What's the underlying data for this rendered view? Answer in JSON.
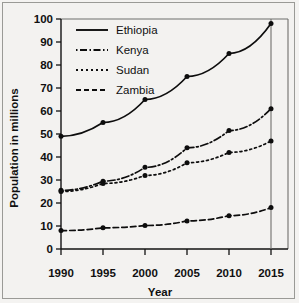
{
  "chart_data": {
    "type": "line",
    "title": "",
    "xlabel": "Year",
    "ylabel": "Population in millions",
    "categories": [
      "1990",
      "1995",
      "2000",
      "2005",
      "2010",
      "2015"
    ],
    "x": [
      1990,
      1995,
      2000,
      2005,
      2010,
      2015
    ],
    "xlim": [
      1990,
      2015
    ],
    "ylim": [
      0,
      100
    ],
    "yticks": [
      0,
      10,
      20,
      30,
      40,
      50,
      60,
      70,
      80,
      90,
      100
    ],
    "xticks": [
      1990,
      1995,
      2000,
      2005,
      2010,
      2015
    ],
    "grid": false,
    "legend_position": "top-left inside plot",
    "series": [
      {
        "name": "Ethiopia",
        "line_style": "solid",
        "marker": "circle",
        "values": [
          49,
          55,
          65,
          75,
          85,
          98
        ]
      },
      {
        "name": "Kenya",
        "line_style": "dash-dot",
        "marker": "circle",
        "values": [
          25.5,
          29.5,
          35.5,
          44,
          51.5,
          61
        ]
      },
      {
        "name": "Sudan",
        "line_style": "dotted",
        "marker": "circle",
        "values": [
          25,
          28.5,
          32,
          37.5,
          42,
          47
        ]
      },
      {
        "name": "Zambia",
        "line_style": "dashed",
        "marker": "circle",
        "values": [
          8,
          9.2,
          10.2,
          12.2,
          14.5,
          18
        ]
      }
    ]
  },
  "axis": {
    "y_tick_labels": [
      "100",
      "90",
      "80",
      "70",
      "60",
      "50",
      "40",
      "30",
      "20",
      "10",
      "0"
    ],
    "x_tick_labels": [
      "1990",
      "1995",
      "2000",
      "2005",
      "2010",
      "2015"
    ],
    "y_title": "Population in millions",
    "x_title": "Year"
  },
  "legend": {
    "entries": [
      {
        "label": "Ethiopia",
        "style": "solid"
      },
      {
        "label": "Kenya",
        "style": "dash-dot"
      },
      {
        "label": "Sudan",
        "style": "dotted"
      },
      {
        "label": "Zambia",
        "style": "dashed"
      }
    ]
  },
  "colors": {
    "ink": "#0d0d0d",
    "paper": "#f3f2f0",
    "frame": "#6f6f6c"
  }
}
